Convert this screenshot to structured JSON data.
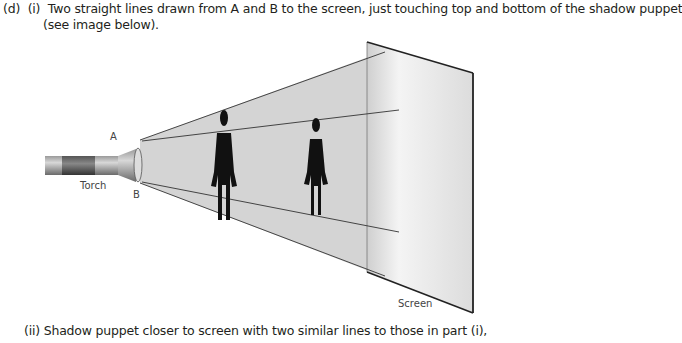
{
  "question": {
    "part_label": "(d)",
    "subpart_i_label": "(i)",
    "subpart_i_text_line1": "Two straight lines drawn from A and B to the screen, just touching top and bottom of the shadow puppet",
    "subpart_i_text_line2": "(see image below).",
    "subpart_ii_label": "(ii)",
    "subpart_ii_text": "Shadow puppet closer to screen with two similar lines to those in part (i),"
  },
  "diagram": {
    "point_a": "A",
    "point_b": "B",
    "torch_label": "Torch",
    "screen_label": "Screen",
    "colors": {
      "beam": "#d6d6d6",
      "screen": "#e9e9e9",
      "lines": "#333333",
      "puppet": "#111111"
    }
  }
}
